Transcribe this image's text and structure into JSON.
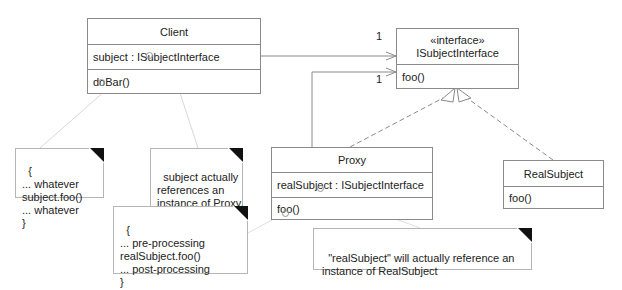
{
  "diagram": {
    "type": "UML class diagram",
    "pattern": "Proxy",
    "classes": {
      "client": {
        "name": "Client",
        "attributes": [
          "subject : ISubjectInterface"
        ],
        "operations": [
          "doBar()"
        ]
      },
      "isubject": {
        "stereotype": "«interface»",
        "name": "ISubjectInterface",
        "operations": [
          "foo()"
        ]
      },
      "proxy": {
        "name": "Proxy",
        "attributes": [
          "realSubject : ISubjectInterface"
        ],
        "operations": [
          "foo()"
        ]
      },
      "realsubject": {
        "name": "RealSubject",
        "operations": [
          "foo()"
        ]
      }
    },
    "associations": [
      {
        "from": "Client",
        "to": "ISubjectInterface",
        "multiplicity": "1"
      },
      {
        "from": "Proxy",
        "to": "ISubjectInterface",
        "multiplicity": "1"
      }
    ],
    "realizations": [
      {
        "from": "Proxy",
        "to": "ISubjectInterface"
      },
      {
        "from": "RealSubject",
        "to": "ISubjectInterface"
      }
    ],
    "notes": {
      "client_code": "{\n... whatever\nsubject.foo()\n... whatever\n}",
      "client_subject": "subject actually\nreferences an\ninstance of Proxy,\nnot RealSubject",
      "proxy_code": "{\n... pre-processing\nrealSubject.foo()\n... post-processing\n}",
      "proxy_realsubject": "\"realSubject\" will actually reference an\ninstance of RealSubject"
    },
    "multiplicities": {
      "client_assoc": "1",
      "proxy_assoc": "1"
    },
    "colors": {
      "line": "#8a8a8a",
      "note_border": "#b5b5b5",
      "note_corner": "#111111",
      "text": "#222222"
    }
  }
}
